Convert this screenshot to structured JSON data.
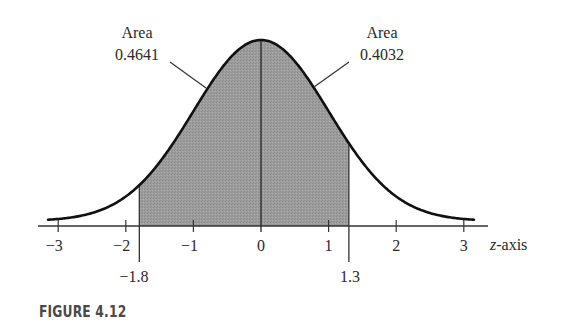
{
  "figure": {
    "caption": "FIGURE 4.12",
    "axis_label_z": "z",
    "axis_label_suffix": "-axis",
    "left_label": {
      "title": "Area",
      "value": "0.4641"
    },
    "right_label": {
      "title": "Area",
      "value": "0.4032"
    },
    "ticks": [
      "−3",
      "−2",
      "−1",
      "0",
      "1",
      "2",
      "3"
    ],
    "marks": {
      "left": "−1.8",
      "right": "1.3"
    },
    "colors": {
      "shade": "#9a9a9a",
      "curve": "#111111",
      "axis": "#333333"
    }
  },
  "chart_data": {
    "type": "area",
    "caption": "FIGURE 4.12",
    "xlabel": "z-axis",
    "ylabel": "",
    "xlim": [
      -3.2,
      3.2
    ],
    "x_ticks": [
      -3,
      -2,
      -1,
      0,
      1,
      2,
      3
    ],
    "grid": false,
    "legend": null,
    "shaded_interval": [
      -1.8,
      1.3
    ],
    "series": [
      {
        "name": "Area between -1.8 and 0",
        "interval": [
          -1.8,
          0
        ],
        "area": 0.4641
      },
      {
        "name": "Area between 0 and 1.3",
        "interval": [
          0,
          1.3
        ],
        "area": 0.4032
      }
    ],
    "annotations": [
      {
        "text": "Area 0.4641",
        "points_to": "left shaded region (-1.8 to 0)"
      },
      {
        "text": "Area 0.4032",
        "points_to": "right shaded region (0 to 1.3)"
      },
      {
        "text": "-1.8",
        "position": "below axis at z = -1.8"
      },
      {
        "text": "1.3",
        "position": "below axis at z = 1.3"
      }
    ],
    "total_shaded_area": 0.8673
  }
}
